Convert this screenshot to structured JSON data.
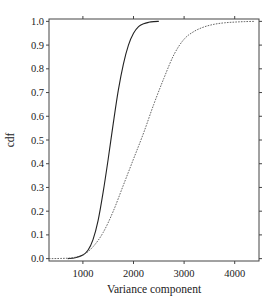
{
  "chart_data": {
    "type": "line",
    "title": "",
    "xlabel": "Variance component",
    "ylabel": "cdf",
    "xlim": [
      330,
      4480
    ],
    "ylim": [
      -0.01,
      1.01
    ],
    "x_ticks": [
      1000,
      2000,
      3000,
      4000
    ],
    "x_tick_labels": [
      "1000",
      "2000",
      "3000",
      "4000"
    ],
    "y_ticks": [
      0.0,
      0.1,
      0.2,
      0.3,
      0.4,
      0.5,
      0.6,
      0.7,
      0.8,
      0.9,
      1.0
    ],
    "y_tick_labels": [
      "0.0",
      "0.1",
      "0.2",
      "0.3",
      "0.4",
      "0.5",
      "0.6",
      "0.7",
      "0.8",
      "0.9",
      "1.0"
    ],
    "grid": false,
    "legend": null,
    "series": [
      {
        "name": "solid",
        "style": "solid",
        "color": "#222222",
        "x": [
          700,
          850,
          1000,
          1100,
          1200,
          1300,
          1400,
          1500,
          1600,
          1700,
          1800,
          1900,
          2000,
          2100,
          2200,
          2300,
          2400,
          2500
        ],
        "y": [
          0.0,
          0.004,
          0.015,
          0.035,
          0.08,
          0.16,
          0.28,
          0.42,
          0.57,
          0.71,
          0.82,
          0.9,
          0.95,
          0.978,
          0.99,
          0.996,
          0.999,
          1.0
        ]
      },
      {
        "name": "dotted",
        "style": "dotted",
        "color": "#555555",
        "x": [
          330,
          600,
          800,
          1000,
          1200,
          1400,
          1600,
          1800,
          2000,
          2200,
          2400,
          2600,
          2800,
          3000,
          3200,
          3400,
          3600,
          3800,
          4000,
          4200,
          4400
        ],
        "y": [
          0.0,
          0.001,
          0.004,
          0.015,
          0.05,
          0.11,
          0.2,
          0.31,
          0.42,
          0.53,
          0.65,
          0.76,
          0.86,
          0.925,
          0.958,
          0.977,
          0.988,
          0.994,
          0.997,
          0.999,
          1.0
        ]
      }
    ]
  }
}
